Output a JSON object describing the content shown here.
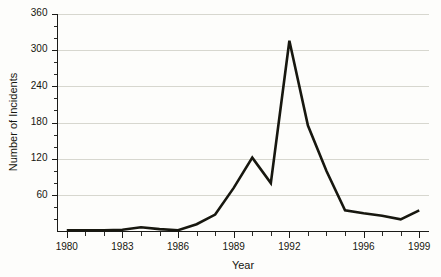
{
  "chart_data": {
    "type": "line",
    "title": "",
    "xlabel": "Year",
    "ylabel": "Number of Incidents",
    "xlim": [
      1979.5,
      1999.5
    ],
    "ylim": [
      0,
      360
    ],
    "grid": true,
    "legend": false,
    "y_ticks": [
      60,
      120,
      180,
      240,
      300,
      360
    ],
    "y_minor_step": 20,
    "x_ticks": [
      1980,
      1981,
      1982,
      1983,
      1984,
      1985,
      1986,
      1987,
      1988,
      1989,
      1990,
      1991,
      1992,
      1993,
      1994,
      1995,
      1996,
      1997,
      1998,
      1999
    ],
    "x_tick_labels": [
      "1980",
      "",
      "",
      "1983",
      "",
      "",
      "1986",
      "",
      "",
      "1989",
      "",
      "",
      "1992",
      "",
      "",
      "",
      "1996",
      "",
      "",
      "1999"
    ],
    "series": [
      {
        "name": "Incidents",
        "color": "#17170f",
        "x": [
          1980,
          1981,
          1982,
          1983,
          1984,
          1985,
          1986,
          1987,
          1988,
          1989,
          1990,
          1991,
          1992,
          1993,
          1994,
          1995,
          1996,
          1997,
          1998,
          1999
        ],
        "values": [
          2,
          2,
          2,
          3,
          7,
          4,
          2,
          12,
          28,
          72,
          122,
          80,
          315,
          175,
          100,
          35,
          30,
          26,
          20,
          35
        ]
      }
    ]
  },
  "labels": {
    "y_axis_title": "Number of Incidents",
    "x_axis_title": "Year",
    "y_360": "360",
    "y_300": "300",
    "y_240": "240",
    "y_180": "180",
    "y_120": "120",
    "y_60": "60",
    "x_1980": "1980",
    "x_1983": "1983",
    "x_1986": "1986",
    "x_1989": "1989",
    "x_1992": "1992",
    "x_1996": "1996",
    "x_1999": "1999"
  },
  "colors": {
    "background": "#fdfdfb",
    "axis": "#1b1b18",
    "grid": "#d7d7cf",
    "line": "#17170f",
    "text": "#16160f"
  }
}
